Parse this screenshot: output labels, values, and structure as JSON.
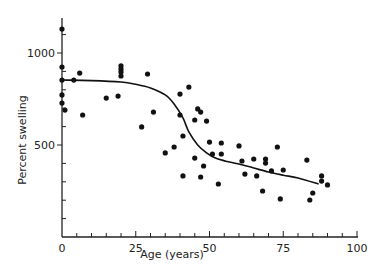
{
  "chart_data": {
    "type": "scatter",
    "title": "",
    "xlabel": "Age (years)",
    "ylabel": "Percent swelling",
    "xlim": [
      0,
      100
    ],
    "ylim": [
      0,
      1200
    ],
    "x_ticks": [
      0,
      25,
      50,
      75,
      100
    ],
    "x_tick_labels": [
      "0",
      "25",
      "50",
      "75",
      "100"
    ],
    "x_minor_step": 5,
    "y_ticks": [
      500,
      1000
    ],
    "y_tick_labels": [
      "500",
      "1000"
    ],
    "y_minor_step": 100,
    "grid": false,
    "legend": null,
    "series": [
      {
        "name": "observations",
        "kind": "scatter",
        "color": "#111111",
        "points": [
          [
            0,
            1130
          ],
          [
            0,
            924
          ],
          [
            6,
            891
          ],
          [
            0,
            853
          ],
          [
            4,
            853
          ],
          [
            0,
            772
          ],
          [
            0,
            728
          ],
          [
            1,
            690
          ],
          [
            7,
            663
          ],
          [
            15,
            755
          ],
          [
            19,
            766
          ],
          [
            20,
            930
          ],
          [
            20,
            913
          ],
          [
            20,
            897
          ],
          [
            20,
            875
          ],
          [
            29,
            886
          ],
          [
            31,
            679
          ],
          [
            27,
            598
          ],
          [
            40,
            777
          ],
          [
            43,
            815
          ],
          [
            40,
            663
          ],
          [
            46,
            696
          ],
          [
            47,
            679
          ],
          [
            45,
            636
          ],
          [
            49,
            630
          ],
          [
            41,
            549
          ],
          [
            35,
            457
          ],
          [
            38,
            489
          ],
          [
            50,
            516
          ],
          [
            54,
            511
          ],
          [
            51,
            451
          ],
          [
            54,
            451
          ],
          [
            45,
            429
          ],
          [
            48,
            386
          ],
          [
            41,
            332
          ],
          [
            47,
            326
          ],
          [
            53,
            288
          ],
          [
            60,
            495
          ],
          [
            61,
            413
          ],
          [
            65,
            424
          ],
          [
            69,
            424
          ],
          [
            69,
            402
          ],
          [
            73,
            489
          ],
          [
            62,
            342
          ],
          [
            66,
            332
          ],
          [
            71,
            359
          ],
          [
            75,
            364
          ],
          [
            68,
            250
          ],
          [
            74,
            207
          ],
          [
            83,
            418
          ],
          [
            85,
            239
          ],
          [
            84,
            201
          ],
          [
            88,
            332
          ],
          [
            88,
            304
          ],
          [
            90,
            283
          ]
        ]
      },
      {
        "name": "fitted curve",
        "kind": "line",
        "color": "#111111",
        "points": [
          [
            0,
            853
          ],
          [
            10,
            850
          ],
          [
            20,
            842
          ],
          [
            25,
            830
          ],
          [
            30,
            810
          ],
          [
            35,
            772
          ],
          [
            38,
            723
          ],
          [
            41,
            647
          ],
          [
            43,
            571
          ],
          [
            46,
            500
          ],
          [
            49,
            457
          ],
          [
            52,
            429
          ],
          [
            56,
            410
          ],
          [
            60,
            397
          ],
          [
            65,
            375
          ],
          [
            70,
            353
          ],
          [
            75,
            336
          ],
          [
            80,
            321
          ],
          [
            87,
            288
          ]
        ]
      }
    ]
  }
}
